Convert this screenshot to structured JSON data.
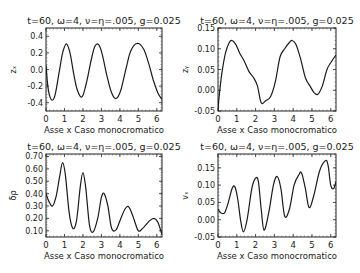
{
  "figure": {
    "layout": "2x2 grid of line plots"
  },
  "chart_data": [
    {
      "type": "line",
      "panel": "top-left",
      "title": "t=60, ω=4, ν=η=.005, g=0.025",
      "xlabel": "Asse x  Caso monocromatico",
      "ylabel": "zₓ",
      "xlim": [
        0,
        6.28
      ],
      "ylim": [
        -0.5,
        0.5
      ],
      "xticks": [
        "0",
        "1",
        "2",
        "3",
        "4",
        "5",
        "6"
      ],
      "yticks": [
        "-0.4",
        "-0.2",
        "0.0",
        "0.2",
        "0.4"
      ],
      "ytick_values": [
        -0.4,
        -0.2,
        0.0,
        0.2,
        0.4
      ],
      "grid": false,
      "x": [
        0,
        0.1,
        0.2,
        0.35,
        0.5,
        0.7,
        0.9,
        1.1,
        1.3,
        1.5,
        1.7,
        1.95,
        2.2,
        2.45,
        2.65,
        2.85,
        3.05,
        3.3,
        3.55,
        3.8,
        4.05,
        4.3,
        4.55,
        4.8,
        5.05,
        5.3,
        5.55,
        5.8,
        6.05,
        6.28
      ],
      "values": [
        0.05,
        -0.2,
        -0.32,
        -0.37,
        -0.3,
        -0.05,
        0.2,
        0.31,
        0.2,
        -0.05,
        -0.25,
        -0.33,
        -0.15,
        0.12,
        0.28,
        0.3,
        0.18,
        -0.08,
        -0.28,
        -0.35,
        -0.25,
        -0.02,
        0.2,
        0.3,
        0.31,
        0.24,
        0.08,
        -0.12,
        -0.28,
        -0.36
      ]
    },
    {
      "type": "line",
      "panel": "top-right",
      "title": "t=60, ω=4, ν=η=.005, g=0.025",
      "xlabel": "Asse x  Caso monocromatico",
      "ylabel": "zᵧ",
      "xlim": [
        0,
        6.28
      ],
      "ylim": [
        -0.05,
        0.15
      ],
      "xticks": [
        "0",
        "1",
        "2",
        "3",
        "4",
        "5",
        "6"
      ],
      "yticks": [
        "-0.05",
        "0.00",
        "0.05",
        "0.10",
        "0.15"
      ],
      "ytick_values": [
        -0.05,
        0.0,
        0.05,
        0.1,
        0.15
      ],
      "grid": false,
      "x": [
        0,
        0.05,
        0.2,
        0.4,
        0.6,
        0.75,
        0.95,
        1.15,
        1.4,
        1.65,
        1.9,
        2.1,
        2.3,
        2.55,
        2.8,
        3.05,
        3.3,
        3.55,
        3.8,
        3.95,
        4.15,
        4.4,
        4.65,
        4.9,
        5.1,
        5.3,
        5.55,
        5.8,
        6.05,
        6.28
      ],
      "values": [
        -0.05,
        -0.02,
        0.04,
        0.09,
        0.115,
        0.12,
        0.11,
        0.09,
        0.07,
        0.045,
        0.03,
        0.01,
        -0.03,
        -0.025,
        -0.015,
        0.02,
        0.08,
        0.1,
        0.115,
        0.12,
        0.11,
        0.075,
        0.03,
        0.01,
        -0.005,
        -0.01,
        0.01,
        0.05,
        0.07,
        0.085
      ]
    },
    {
      "type": "line",
      "panel": "bottom-left",
      "title": "t=60, ω=4, ν=η=.005, g=0.025",
      "xlabel": "Asse x  Caso monocromatico",
      "ylabel": "δρ",
      "xlim": [
        0,
        6.28
      ],
      "ylim": [
        0.05,
        0.72
      ],
      "xticks": [
        "0",
        "1",
        "2",
        "3",
        "4",
        "5",
        "6"
      ],
      "yticks": [
        "0.10",
        "0.20",
        "0.30",
        "0.40",
        "0.50",
        "0.60",
        "0.70"
      ],
      "ytick_values": [
        0.1,
        0.2,
        0.3,
        0.4,
        0.5,
        0.6,
        0.7
      ],
      "grid": false,
      "x": [
        0,
        0.15,
        0.35,
        0.55,
        0.75,
        0.9,
        1.05,
        1.25,
        1.45,
        1.65,
        1.85,
        2.0,
        2.15,
        2.35,
        2.55,
        2.8,
        3.0,
        3.15,
        3.35,
        3.55,
        3.8,
        4.05,
        4.3,
        4.5,
        4.75,
        5.0,
        5.3,
        5.6,
        5.85,
        6.05,
        6.28
      ],
      "values": [
        0.4,
        0.34,
        0.3,
        0.38,
        0.55,
        0.65,
        0.55,
        0.25,
        0.12,
        0.18,
        0.45,
        0.57,
        0.45,
        0.15,
        0.09,
        0.2,
        0.37,
        0.4,
        0.3,
        0.12,
        0.11,
        0.2,
        0.28,
        0.29,
        0.2,
        0.1,
        0.13,
        0.18,
        0.2,
        0.17,
        0.07
      ]
    },
    {
      "type": "line",
      "panel": "bottom-right",
      "title": "t=60, ω=4, ν=η=.005, g=0.025",
      "xlabel": "Asse x  Caso monocromatico",
      "ylabel": "vₓ",
      "xlim": [
        0,
        6.28
      ],
      "ylim": [
        -0.05,
        0.19
      ],
      "xticks": [
        "0",
        "1",
        "2",
        "3",
        "4",
        "5",
        "6"
      ],
      "yticks": [
        "-0.05",
        "0.00",
        "0.05",
        "0.10",
        "0.15"
      ],
      "ytick_values": [
        -0.05,
        0.0,
        0.05,
        0.1,
        0.15
      ],
      "grid": false,
      "x": [
        0,
        0.15,
        0.35,
        0.55,
        0.75,
        0.9,
        1.05,
        1.2,
        1.35,
        1.55,
        1.8,
        2.0,
        2.15,
        2.3,
        2.45,
        2.7,
        2.95,
        3.15,
        3.35,
        3.55,
        3.8,
        4.05,
        4.3,
        4.45,
        4.65,
        4.85,
        5.1,
        5.4,
        5.7,
        5.85,
        6.0,
        6.15,
        6.28
      ],
      "values": [
        0.03,
        0.02,
        0.02,
        0.05,
        0.09,
        0.095,
        0.06,
        0.0,
        -0.035,
        0.0,
        0.09,
        0.12,
        0.11,
        0.03,
        -0.03,
        0.02,
        0.1,
        0.125,
        0.09,
        0.01,
        0.03,
        0.1,
        0.13,
        0.135,
        0.09,
        0.035,
        0.07,
        0.14,
        0.17,
        0.16,
        0.1,
        0.09,
        0.11
      ]
    }
  ]
}
